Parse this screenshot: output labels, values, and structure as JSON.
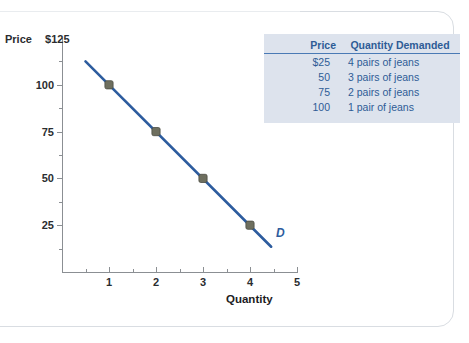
{
  "chart_data": {
    "type": "line",
    "title": "",
    "xlabel": "Quantity",
    "ylabel": "Price",
    "y_axis_top_label": "$125",
    "xlim": [
      0,
      5
    ],
    "ylim": [
      0,
      125
    ],
    "grid": false,
    "x_ticks": [
      "1",
      "2",
      "3",
      "4",
      "5"
    ],
    "y_ticks": [
      "100",
      "75",
      "50",
      "25"
    ],
    "x_minor_ticks": [
      0.5,
      1.5,
      2.5,
      3.5,
      4.5
    ],
    "y_minor_ticks": [
      112.5,
      87.5,
      62.5,
      37.5,
      12.5
    ],
    "series": [
      {
        "name": "D",
        "label": "D",
        "color": "#2d5c9e",
        "points": [
          {
            "x": 1,
            "y": 100
          },
          {
            "x": 2,
            "y": 75
          },
          {
            "x": 3,
            "y": 50
          },
          {
            "x": 4,
            "y": 25
          }
        ],
        "line_extends_from": {
          "x": 0.5,
          "y": 112.5
        },
        "line_extends_to": {
          "x": 4.45,
          "y": 13.5
        }
      }
    ],
    "marker_color": "#6e6f5f"
  },
  "axes": {
    "y_title": "Price",
    "y_top_value": "$125",
    "x_title": "Quantity"
  },
  "table": {
    "headers": [
      "Price",
      "Quantity Demanded"
    ],
    "rows": [
      {
        "price": "$25",
        "quantity": "4 pairs of jeans"
      },
      {
        "price": "50",
        "quantity": "3 pairs of jeans"
      },
      {
        "price": "75",
        "quantity": "2 pairs of jeans"
      },
      {
        "price": "100",
        "quantity": "1 pair of jeans"
      }
    ],
    "background": "#dde3ed",
    "text_color": "#2e5c96"
  },
  "series_label": "D",
  "colors": {
    "line": "#2d5c9e",
    "marker": "#6e6f5f",
    "axis": "#8b8f93",
    "table_bg": "#dde3ed",
    "table_text": "#2e5c96",
    "card_border": "#d9dde2"
  }
}
